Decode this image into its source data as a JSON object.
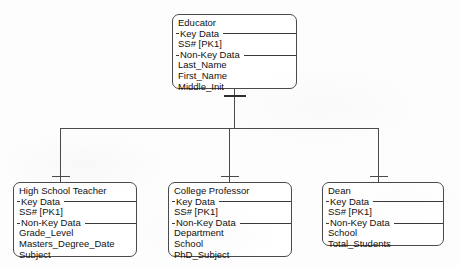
{
  "diagram": {
    "type": "supertype-subtype ER diagram",
    "notation": "IDEF1X",
    "background_color": "#fdfdfd",
    "line_color": "#4a4a4a"
  },
  "labels": {
    "key_data": "Key Data",
    "non_key_data": "Non-Key Data"
  },
  "supertype": {
    "name": "Educator",
    "key_attributes": [
      "SS#   [PK1]"
    ],
    "non_key_attributes": [
      "Last_Name",
      "First_Name",
      "Middle_Init"
    ]
  },
  "subtypes": [
    {
      "name": "High School Teacher",
      "key_attributes": [
        "SS#   [PK1]"
      ],
      "non_key_attributes": [
        "Grade_Level",
        "Masters_Degree_Date",
        "Subject"
      ]
    },
    {
      "name": "College Professor",
      "key_attributes": [
        "SS#   [PK1]"
      ],
      "non_key_attributes": [
        "Department",
        "School",
        "PhD_Subject"
      ]
    },
    {
      "name": "Dean",
      "key_attributes": [
        "SS#   [PK1]"
      ],
      "non_key_attributes": [
        "School",
        "Total_Students"
      ]
    }
  ]
}
